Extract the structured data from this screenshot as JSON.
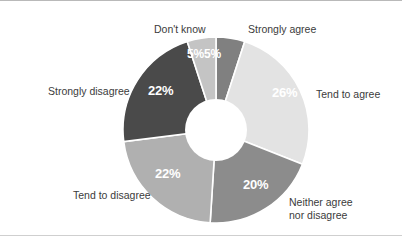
{
  "chart_data": {
    "type": "pie",
    "variant": "donut",
    "title": "",
    "subtitle": "",
    "xlabel": "",
    "ylabel": "",
    "legend_position": "outside-labels",
    "grid": false,
    "units": "percent",
    "total": 100,
    "start_angle_deg": 0,
    "direction": "clockwise",
    "categories": [
      "Strongly agree",
      "Tend to agree",
      "Neither agree nor disagree",
      "Tend to disagree",
      "Strongly disagree",
      "Don't know"
    ],
    "values": [
      5,
      26,
      20,
      22,
      22,
      5
    ],
    "value_labels": [
      "5%",
      "26%",
      "20%",
      "22%",
      "22%",
      "5%"
    ],
    "colors": [
      "#808080",
      "#e3e3e3",
      "#8c8c8c",
      "#b0b0b0",
      "#4a4a4a",
      "#c4c4c4"
    ],
    "slice_label_color": "#ffffff",
    "separator_color": "#ffffff",
    "background_color": "#ffffff",
    "label_text_color": "#3b3b3b"
  },
  "labels": {
    "dont_know": "Don't know",
    "strongly_agree": "Strongly agree",
    "tend_to_agree": "Tend to agree",
    "neither_line1": "Neither agree",
    "neither_line2": "nor disagree",
    "tend_to_disagree": "Tend to disagree",
    "strongly_disagree": "Strongly disagree"
  },
  "values": {
    "strongly_agree": "5%",
    "tend_to_agree": "26%",
    "neither": "20%",
    "tend_to_disagree": "22%",
    "strongly_disagree": "22%",
    "dont_know": "5%"
  }
}
